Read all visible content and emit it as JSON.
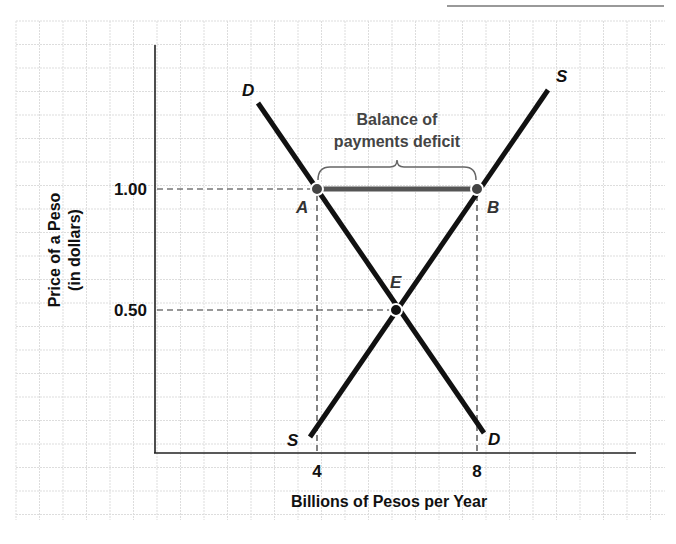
{
  "chart_data": {
    "type": "line",
    "title": "",
    "xlabel": "Billions of Pesos per Year",
    "ylabel_line1": "Price of a Peso",
    "ylabel_line2": "(in dollars)",
    "x_ticks": [
      "4",
      "8"
    ],
    "y_ticks": [
      "1.00",
      "0.50"
    ],
    "grid": true,
    "legend": null,
    "series": [
      {
        "name": "D",
        "label_top": "D",
        "label_bottom": "D",
        "description": "Demand for pesos (downward sloping)",
        "points": [
          {
            "x": 2.8,
            "y": 1.36
          },
          {
            "x": 4,
            "y": 1.0
          },
          {
            "x": 6,
            "y": 0.5
          },
          {
            "x": 8.1,
            "y": 0.04
          }
        ]
      },
      {
        "name": "S",
        "label_top": "S",
        "label_bottom": "S",
        "description": "Supply of pesos (upward sloping)",
        "points": [
          {
            "x": 3.9,
            "y": 0.04
          },
          {
            "x": 6,
            "y": 0.5
          },
          {
            "x": 8,
            "y": 1.0
          },
          {
            "x": 9.8,
            "y": 1.4
          }
        ]
      }
    ],
    "points": [
      {
        "name": "A",
        "x": 4,
        "y": 1.0
      },
      {
        "name": "B",
        "x": 8,
        "y": 1.0
      },
      {
        "name": "E",
        "x": 6,
        "y": 0.5
      }
    ],
    "annotations": [
      {
        "text_line1": "Balance of",
        "text_line2": "payments deficit",
        "from": "A",
        "to": "B",
        "style": "brace"
      }
    ],
    "reference_lines": [
      {
        "type": "horizontal-dashed",
        "y": 1.0,
        "label": "1.00"
      },
      {
        "type": "horizontal-dashed",
        "y": 0.5,
        "label": "0.50"
      },
      {
        "type": "vertical-dashed",
        "x": 4,
        "label": "4"
      },
      {
        "type": "vertical-dashed",
        "x": 8,
        "label": "8"
      }
    ]
  },
  "colors": {
    "grid": "#dddddd",
    "axis": "#222222",
    "curve": "#111111",
    "deficit_bar": "#555555",
    "point_fill": "#444444",
    "annotation_text": "#444444"
  }
}
